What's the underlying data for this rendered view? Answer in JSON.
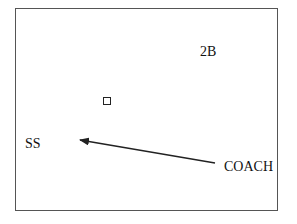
{
  "diagram": {
    "type": "play-diagram",
    "frame": {
      "border_color": "#555555"
    },
    "positions": [
      {
        "id": "2b",
        "label": "2B"
      },
      {
        "id": "ss",
        "label": "SS"
      },
      {
        "id": "coach",
        "label": "COACH"
      }
    ],
    "markers": [
      {
        "id": "base-marker",
        "shape": "square"
      }
    ],
    "arrows": [
      {
        "id": "coach-to-ss",
        "from": "COACH",
        "to": "SS",
        "color": "#222222"
      }
    ]
  }
}
